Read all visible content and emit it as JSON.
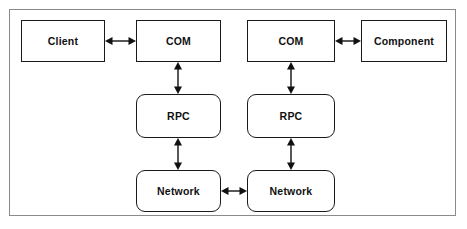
{
  "diagram": {
    "background_color": "#ffffff",
    "frame_color": "#8a8a8a",
    "node_border_color": "#1a1a1a",
    "arrow_color": "#111111",
    "nodes": [
      {
        "id": "client",
        "label": "Client",
        "shape": "rectangle",
        "x": 21,
        "y": 20,
        "w": 84,
        "h": 42
      },
      {
        "id": "com-left",
        "label": "COM",
        "shape": "rectangle",
        "x": 136,
        "y": 20,
        "w": 85,
        "h": 42
      },
      {
        "id": "com-right",
        "label": "COM",
        "shape": "rectangle",
        "x": 247,
        "y": 20,
        "w": 88,
        "h": 42
      },
      {
        "id": "component",
        "label": "Component",
        "shape": "rectangle",
        "x": 361,
        "y": 20,
        "w": 86,
        "h": 42
      },
      {
        "id": "rpc-left",
        "label": "RPC",
        "shape": "rounded-rectangle",
        "x": 136,
        "y": 94,
        "w": 85,
        "h": 44
      },
      {
        "id": "rpc-right",
        "label": "RPC",
        "shape": "rounded-rectangle",
        "x": 247,
        "y": 94,
        "w": 88,
        "h": 44
      },
      {
        "id": "net-left",
        "label": "Network",
        "shape": "rounded-rectangle",
        "x": 136,
        "y": 170,
        "w": 85,
        "h": 42
      },
      {
        "id": "net-right",
        "label": "Network",
        "shape": "rounded-rectangle",
        "x": 247,
        "y": 170,
        "w": 88,
        "h": 42
      }
    ],
    "connectors": [
      {
        "id": "client-com",
        "from": "client",
        "to": "com-left",
        "orientation": "horizontal",
        "heads": "double"
      },
      {
        "id": "com-component",
        "from": "com-right",
        "to": "component",
        "orientation": "horizontal",
        "heads": "double"
      },
      {
        "id": "com-rpc-left",
        "from": "com-left",
        "to": "rpc-left",
        "orientation": "vertical",
        "heads": "double"
      },
      {
        "id": "com-rpc-right",
        "from": "com-right",
        "to": "rpc-right",
        "orientation": "vertical",
        "heads": "double"
      },
      {
        "id": "rpc-net-left",
        "from": "rpc-left",
        "to": "net-left",
        "orientation": "vertical",
        "heads": "double"
      },
      {
        "id": "rpc-net-right",
        "from": "rpc-right",
        "to": "net-right",
        "orientation": "vertical",
        "heads": "double"
      },
      {
        "id": "net-net",
        "from": "net-left",
        "to": "net-right",
        "orientation": "horizontal",
        "heads": "double"
      }
    ]
  }
}
